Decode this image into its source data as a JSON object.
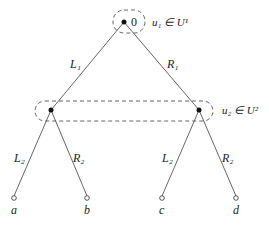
{
  "diagram": {
    "type": "game-tree",
    "root": {
      "label": "0",
      "info_set_label": "u₁ ∈ U¹",
      "x": 124,
      "y": 22
    },
    "level1_edges": [
      {
        "label": "L₁",
        "from": "root",
        "to": "n1"
      },
      {
        "label": "R₁",
        "from": "root",
        "to": "n2"
      }
    ],
    "level2_nodes": [
      {
        "id": "n1",
        "x": 51,
        "y": 110
      },
      {
        "id": "n2",
        "x": 199,
        "y": 110
      }
    ],
    "info_set_2_label": "u₂ ∈ U²",
    "level2_edges": [
      {
        "label": "L₂",
        "from": "n1",
        "to": "a"
      },
      {
        "label": "R₂",
        "from": "n1",
        "to": "b"
      },
      {
        "label": "L₂",
        "from": "n2",
        "to": "c"
      },
      {
        "label": "R₂",
        "from": "n2",
        "to": "d"
      }
    ],
    "leaves": [
      {
        "id": "a",
        "label": "a",
        "x": 14,
        "y": 198
      },
      {
        "id": "b",
        "label": "b",
        "x": 87,
        "y": 198
      },
      {
        "id": "c",
        "label": "c",
        "x": 162,
        "y": 198
      },
      {
        "id": "d",
        "label": "d",
        "x": 236,
        "y": 198
      }
    ],
    "colors": {
      "line": "#555555",
      "node": "#111111",
      "dash": "#555555"
    }
  }
}
